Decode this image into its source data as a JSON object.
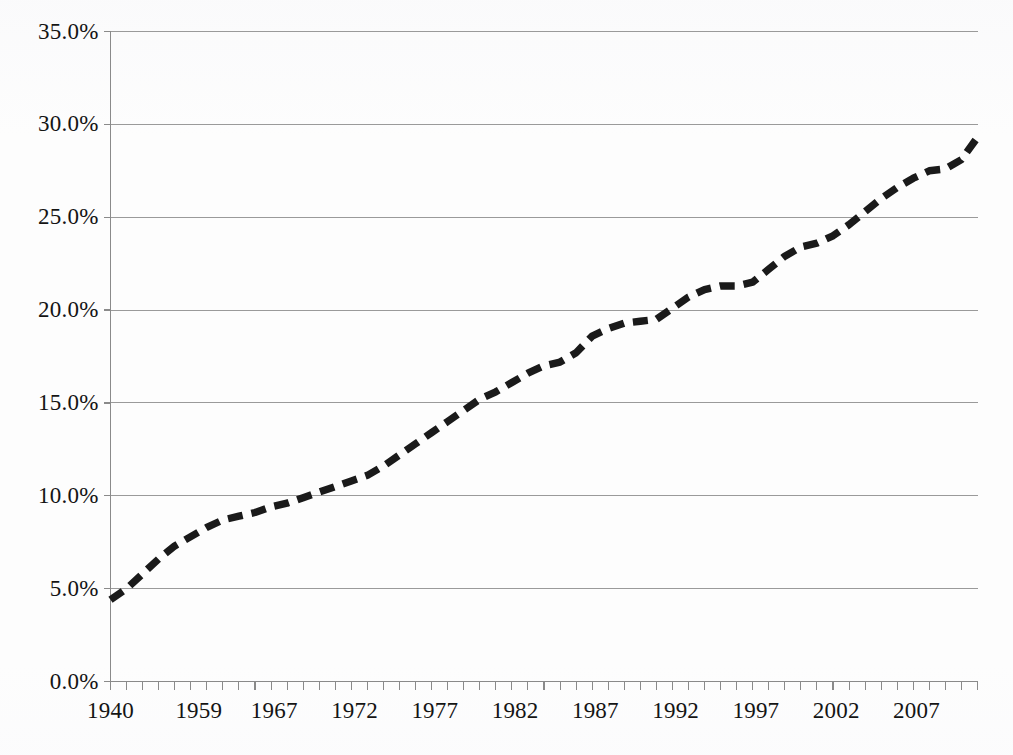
{
  "chart_data": {
    "type": "line",
    "title": "",
    "subtitle": "",
    "xlabel": "",
    "ylabel": "",
    "legend": [],
    "legend_position": "none",
    "grid": true,
    "grid_axis": "y",
    "line_style": "dashed",
    "line_color": "#1a1a1a",
    "grid_color": "#9a9a9a",
    "axis_color": "#8a8a8a",
    "background_color": "#fdfdfd",
    "xlim": [
      1940,
      1994
    ],
    "ylim": [
      0,
      35
    ],
    "y_tick_values": [
      0,
      5,
      10,
      15,
      20,
      25,
      30,
      35
    ],
    "y_tick_labels": [
      "0.0%",
      "5.0%",
      "10.0%",
      "15.0%",
      "20.0%",
      "25.0%",
      "30.0%",
      "35.0%"
    ],
    "x_tick_labels": [
      "1940",
      "1959",
      "1967",
      "1972",
      "1977",
      "1982",
      "1987",
      "1992",
      "1997",
      "2002",
      "2007"
    ],
    "x_tick_label_positions": [
      1940,
      1945.5,
      1950.2,
      1955.2,
      1960.2,
      1965.2,
      1970.2,
      1975.2,
      1980.2,
      1985.2,
      1990.2
    ],
    "x_minor_tick_count": 54,
    "x": [
      1940,
      1941,
      1942,
      1943,
      1944,
      1945,
      1946,
      1947,
      1948,
      1949,
      1950,
      1951,
      1952,
      1953,
      1954,
      1955,
      1956,
      1957,
      1958,
      1959,
      1960,
      1961,
      1962,
      1963,
      1964,
      1965,
      1966,
      1967,
      1968,
      1969,
      1970,
      1971,
      1972,
      1973,
      1974,
      1975,
      1976,
      1977,
      1978,
      1979,
      1980,
      1981,
      1982,
      1983,
      1984,
      1985,
      1986,
      1987,
      1988,
      1989,
      1990,
      1991,
      1992,
      1993,
      1994
    ],
    "values": [
      4.4,
      5.0,
      5.8,
      6.6,
      7.3,
      7.8,
      8.3,
      8.7,
      8.9,
      9.1,
      9.4,
      9.6,
      9.9,
      10.2,
      10.5,
      10.8,
      11.1,
      11.6,
      12.2,
      12.8,
      13.4,
      14.0,
      14.6,
      15.2,
      15.6,
      16.1,
      16.6,
      17.0,
      17.2,
      17.7,
      18.6,
      19.0,
      19.3,
      19.4,
      19.5,
      20.1,
      20.7,
      21.1,
      21.3,
      21.3,
      21.5,
      22.2,
      22.9,
      23.4,
      23.6,
      24.0,
      24.6,
      25.3,
      26.0,
      26.6,
      27.1,
      27.5,
      27.6,
      28.1,
      29.3
    ]
  }
}
